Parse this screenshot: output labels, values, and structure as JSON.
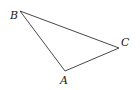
{
  "diagram": {
    "type": "triangle",
    "stroke_color": "#333333",
    "vertices": [
      {
        "name": "B",
        "label": "B",
        "x": 20,
        "y": 11,
        "label_x": 10,
        "label_y": 19
      },
      {
        "name": "C",
        "label": "C",
        "x": 119,
        "y": 48,
        "label_x": 121,
        "label_y": 46
      },
      {
        "name": "A",
        "label": "A",
        "x": 65,
        "y": 71,
        "label_x": 60,
        "label_y": 84
      }
    ],
    "edges": [
      {
        "from": "B",
        "to": "C"
      },
      {
        "from": "C",
        "to": "A"
      },
      {
        "from": "A",
        "to": "B"
      }
    ]
  }
}
